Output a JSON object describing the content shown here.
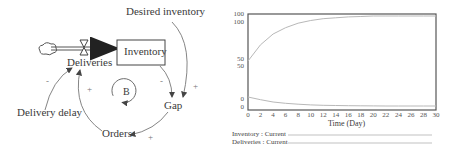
{
  "diagram": {
    "stock": "Inventory",
    "flow": "Deliveries",
    "variables": [
      "Desired inventory",
      "Gap",
      "Orders",
      "Delivery delay"
    ],
    "loop_label": "B",
    "polarities": {
      "delivery_delay_to_deliveries": "-",
      "orders_to_deliveries": "+",
      "inventory_to_gap": "-",
      "desired_inventory_to_gap": "+",
      "gap_to_orders": "+"
    }
  },
  "chart_data": {
    "type": "line",
    "title": "",
    "xlabel": "Time (Day)",
    "ylabel": "",
    "x_ticks": [
      0,
      2,
      4,
      6,
      8,
      10,
      12,
      14,
      16,
      18,
      20,
      22,
      24,
      26,
      28,
      30
    ],
    "y_ticks_inventory": [
      0,
      50,
      100
    ],
    "y_ticks_deliveries": [
      0,
      50,
      100
    ],
    "xlim": [
      0,
      30
    ],
    "ylim": [
      0,
      100
    ],
    "grid": false,
    "legend_position": "bottom",
    "x": [
      0,
      2,
      4,
      6,
      8,
      10,
      12,
      14,
      16,
      18,
      20,
      22,
      24,
      26,
      28,
      30
    ],
    "series": [
      {
        "name": "Inventory : Current",
        "values": [
          50,
          68,
          80,
          87,
          92,
          95,
          97,
          98,
          99,
          99.5,
          100,
          100,
          100,
          100,
          100,
          100
        ]
      },
      {
        "name": "Deliveries : Current",
        "values": [
          10,
          7,
          4.5,
          3,
          2,
          1.2,
          0.8,
          0.5,
          0.3,
          0.2,
          0.1,
          0,
          0,
          0,
          0,
          0
        ]
      }
    ]
  },
  "legend": {
    "inventory": "Inventory : Current",
    "deliveries": "Deliveries : Current"
  },
  "colors": {
    "curve": "#b8b8b8",
    "frame": "#555555",
    "arrow": "#666666"
  }
}
